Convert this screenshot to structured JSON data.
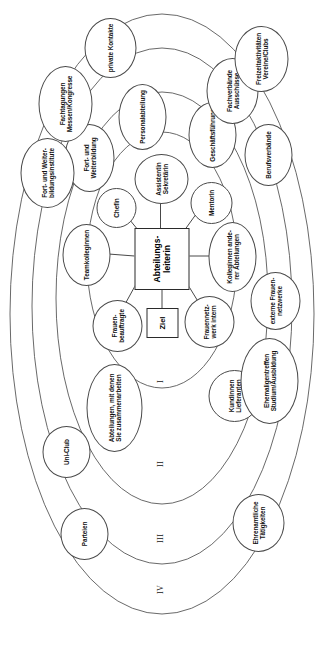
{
  "figure": {
    "kind": "concentric-network-diagram",
    "language": "de",
    "center": {
      "label": "Abteilungs-\nleiterin",
      "goal_label": "Ziel"
    },
    "ring_labels": [
      {
        "id": "ring-1",
        "label": "I"
      },
      {
        "id": "ring-2",
        "label": "II"
      },
      {
        "id": "ring-3",
        "label": "III"
      },
      {
        "id": "ring-4",
        "label": "IV"
      }
    ],
    "line_color": "#555555",
    "text_color": "#111111",
    "background": "#ffffff"
  },
  "nodes": {
    "ring1": [
      {
        "id": "frauenbeauftragte",
        "label": "Frauen-\nbeauftragte"
      },
      {
        "id": "teamkolleginnen",
        "label": "Teamkolleginnen"
      },
      {
        "id": "chefin",
        "label": "Chefin"
      },
      {
        "id": "assistentin-sekretaerin",
        "label": "Assistentin\nSekretärin"
      },
      {
        "id": "mentorin",
        "label": "Mentorin"
      },
      {
        "id": "kolleginnen-anderer-abteilungen",
        "label": "Kolleginnen ande-\nrer Abteilungen"
      },
      {
        "id": "frauennetzwerk-intern",
        "label": "Frauennetz-\nwerk intern"
      }
    ],
    "ring2": [
      {
        "id": "abteilungen-zusammenarbeit",
        "label": "Abteilungen, mit denen\nSie zusammenarbeiten"
      },
      {
        "id": "fort-und-weiterbildung",
        "label": "Fort- und\nWeiterbildung"
      },
      {
        "id": "personalabteilung",
        "label": "Personalabteilung"
      },
      {
        "id": "geschaeftsfuehrung",
        "label": "Geschäftsführung"
      },
      {
        "id": "kundinnen-lieferanten",
        "label": "Kundinnen\nLieferanten"
      }
    ],
    "ring3": [
      {
        "id": "fort-und-weiterbildungsinstitute",
        "label": "Fort- und Weiter-\nbildungsinstitute"
      },
      {
        "id": "fachtagungen-messen-kongresse",
        "label": "Fachtagungen\nMessen/Kongresse"
      },
      {
        "id": "fachverbaende-ausschuesse",
        "label": "Fachverbände\nAusschüsse"
      },
      {
        "id": "berufsverbaende",
        "label": "Berufsverbände"
      },
      {
        "id": "ehemaligentreffen",
        "label": "Ehemaligentreffen\nStudium/Ausbildung"
      },
      {
        "id": "externe-frauennetzwerke",
        "label": "externe Frauen-\nnetzwerke"
      }
    ],
    "ring4": [
      {
        "id": "parteien",
        "label": "Parteien"
      },
      {
        "id": "uni-club",
        "label": "Uni-Club"
      },
      {
        "id": "private-kontakte",
        "label": "private Kontakte"
      },
      {
        "id": "freizeitaktivitaeten",
        "label": "Freizeitaktivitäten\nVereine/Clubs"
      },
      {
        "id": "ehrenamtliche-taetigkeiten",
        "label": "Ehrenamtliche\nTätigkeiten"
      }
    ]
  }
}
